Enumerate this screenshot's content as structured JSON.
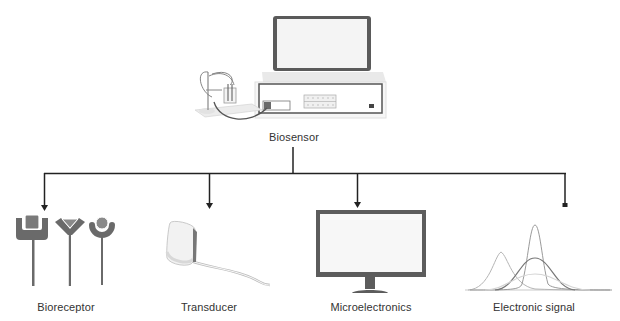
{
  "diagram": {
    "root": {
      "label": "Biosensor",
      "icon": "laptop-with-analyzer-and-electrochemical-cell-icon"
    },
    "components": [
      {
        "label": "Bioreceptor",
        "icon": "bioreceptor-probes-icon"
      },
      {
        "label": "Transducer",
        "icon": "transducer-sensor-icon"
      },
      {
        "label": "Microelectronics",
        "icon": "monitor-icon"
      },
      {
        "label": "Electronic signal",
        "icon": "gaussian-peaks-signal-icon"
      }
    ],
    "colors": {
      "line": "#222222",
      "icon_dark": "#555555",
      "icon_mid": "#8a8a8a",
      "icon_light": "#c8c8c8"
    }
  }
}
